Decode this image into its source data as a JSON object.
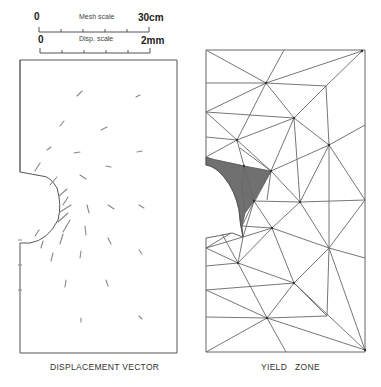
{
  "scales": {
    "mesh": {
      "start": "0",
      "label": "Mesh scale",
      "end": "30cm"
    },
    "disp": {
      "start": "0",
      "label": "Disp. scale",
      "end": "2mm"
    }
  },
  "panels": {
    "left": {
      "caption": "DISPLACEMENT VECTOR"
    },
    "right": {
      "caption": "YIELD   ZONE"
    }
  },
  "colors": {
    "line": "#555555",
    "yield_fill": "#6e6e6e",
    "arrow": "#777777"
  }
}
